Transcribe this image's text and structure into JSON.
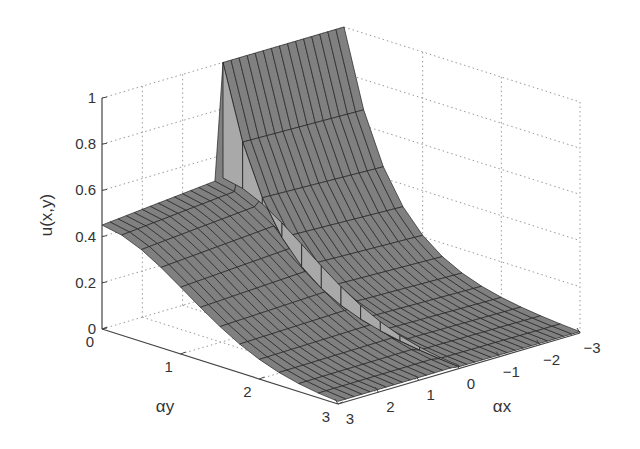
{
  "chart_data": {
    "type": "surface3d",
    "title": "",
    "zlabel": "u(x,y)",
    "xlabel": "αx",
    "ylabel": "αy",
    "x_ticks": [
      "3",
      "2",
      "1",
      "0",
      "−1",
      "−2",
      "−3"
    ],
    "y_ticks": [
      "0",
      "1",
      "2",
      "3"
    ],
    "z_ticks": [
      "0",
      "0.2",
      "0.4",
      "0.6",
      "0.8",
      "1"
    ],
    "xlim": [
      -3,
      3
    ],
    "ylim": [
      0,
      3
    ],
    "zlim": [
      0,
      1
    ],
    "grid": true,
    "grid_style": "dotted",
    "surface_color": "#808080",
    "edge_color": "#222222",
    "samples": {
      "x": [
        -3,
        -2,
        -1,
        0,
        1,
        2,
        3
      ],
      "y": [
        0,
        0.5,
        1,
        1.5,
        2,
        2.5,
        3
      ],
      "z_at_y0": [
        1.0,
        1.0,
        1.0,
        0.5,
        0.5,
        0.5,
        0.5
      ],
      "z_profile_x_negative": [
        1.0,
        0.72,
        0.52,
        0.37,
        0.26,
        0.16,
        0.05
      ],
      "z_profile_x_positive": [
        0.5,
        0.46,
        0.34,
        0.22,
        0.12,
        0.05,
        0.0
      ]
    }
  }
}
